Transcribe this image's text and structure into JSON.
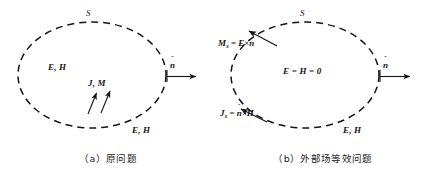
{
  "figure": {
    "background_color": "#ffffff",
    "stroke_color": "#141414",
    "panels": [
      {
        "id": "a",
        "caption": "（a）原问题",
        "surface_label": "S",
        "ellipse": {
          "cx": 92,
          "cy": 75,
          "rx": 74,
          "ry": 53
        },
        "normal_vector": {
          "label": "n",
          "hat": "ˆ"
        },
        "labels": [
          {
            "name": "interior-field",
            "text": "E, H",
            "x": 48,
            "y": 62
          },
          {
            "name": "source-currents",
            "text": "J, M",
            "x": 88,
            "y": 78
          },
          {
            "name": "exterior-field",
            "text": "E, H",
            "x": 132,
            "y": 126
          }
        ],
        "source_arrows": [
          {
            "x1": 88,
            "y1": 114,
            "x2": 96,
            "y2": 92
          },
          {
            "x1": 101,
            "y1": 113,
            "x2": 110,
            "y2": 90
          }
        ]
      },
      {
        "id": "b",
        "caption": "（b）外部场等效问题",
        "surface_label": "S",
        "ellipse": {
          "cx": 90,
          "cy": 75,
          "rx": 74,
          "ry": 53
        },
        "normal_vector": {
          "label": "n",
          "hat": "ˆ"
        },
        "interior_null_field": "E = H = 0",
        "magnetic_surface_current": {
          "symbol": "M",
          "subscript": "s",
          "equals": "=",
          "expr_a": "E",
          "cross": "×",
          "expr_b": "n",
          "hat": "ˆ"
        },
        "electric_surface_current": {
          "symbol": "J",
          "subscript": "s",
          "equals": "=",
          "expr_a": "n",
          "hat": "ˆ",
          "cross": "×",
          "expr_b": "H"
        },
        "labels": [
          {
            "name": "exterior-field",
            "text": "E, H",
            "x": 128,
            "y": 126
          }
        ]
      }
    ]
  }
}
